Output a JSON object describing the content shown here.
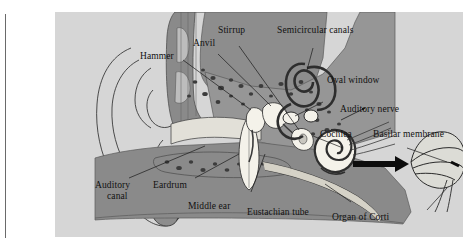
{
  "figure": {
    "panel_background": "#d6d6d6",
    "page_background": "#ffffff",
    "bone_color": "#8a8a8a",
    "tissue_color": "#9a9a9a",
    "structure_color": "#f2f2ef",
    "line_color": "#1a1a1a"
  },
  "labels": [
    {
      "id": "hammer",
      "text": "Hammer"
    },
    {
      "id": "anvil",
      "text": "Anvil"
    },
    {
      "id": "stirrup",
      "text": "Stirrup"
    },
    {
      "id": "semicircular-canals",
      "text": "Semicircular canals"
    },
    {
      "id": "oval-window",
      "text": "Oval window"
    },
    {
      "id": "auditory-nerve",
      "text": "Auditory nerve"
    },
    {
      "id": "cochlea",
      "text": "Cochlea"
    },
    {
      "id": "basilar-membrane",
      "text": "Basilar membrane"
    },
    {
      "id": "organ-of-corti",
      "text": "Organ of Corti"
    },
    {
      "id": "auditory-canal-1",
      "text": "Auditory"
    },
    {
      "id": "auditory-canal-2",
      "text": "canal"
    },
    {
      "id": "eardrum",
      "text": "Eardrum"
    },
    {
      "id": "middle-ear",
      "text": "Middle ear"
    },
    {
      "id": "eustachian-tube",
      "text": "Eustachian tube"
    }
  ]
}
